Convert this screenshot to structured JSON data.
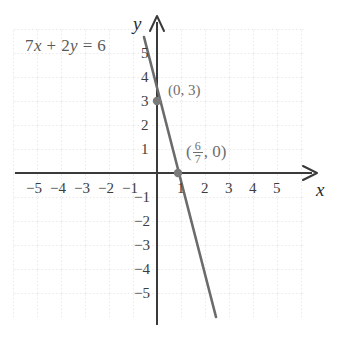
{
  "chart_data": {
    "type": "line",
    "title": "",
    "equation_label": "7x + 2y = 6",
    "equation_parts": {
      "coef_x": "7",
      "var_x": "x",
      "plus": "+",
      "coef_y": "2",
      "var_y": "y",
      "equals": "=",
      "constant": "6"
    },
    "xlabel": "x",
    "ylabel": "y",
    "xlim": [
      -6,
      6
    ],
    "ylim": [
      -6,
      6
    ],
    "grid": true,
    "grid_style": "dotted",
    "x_ticks": [
      -5,
      -4,
      -3,
      -2,
      -1,
      1,
      2,
      3,
      4,
      5
    ],
    "y_ticks": [
      5,
      4,
      3,
      2,
      1,
      -1,
      -2,
      -3,
      -4,
      -5
    ],
    "x_tick_labels": [
      "−5",
      "−4",
      "−3",
      "−2",
      "−1",
      "1",
      "2",
      "3",
      "4",
      "5"
    ],
    "y_tick_labels": [
      "5",
      "4",
      "3",
      "2",
      "1",
      "−1",
      "−2",
      "−3",
      "−4",
      "−5"
    ],
    "series": [
      {
        "name": "7x + 2y = 6",
        "slope": -3.5,
        "intercept": 3,
        "x_start": -0.55,
        "x_end": 2.45,
        "color": "#6b6b6b"
      }
    ],
    "points": [
      {
        "name": "y-intercept",
        "x": 0,
        "y": 3,
        "label": "(0, 3)"
      },
      {
        "name": "x-intercept",
        "x": 0.857,
        "y": 0,
        "label_prefix": "(",
        "label_num": "6",
        "label_den": "7",
        "label_suffix": ", 0)"
      }
    ],
    "colors": {
      "line": "#6b6b6b",
      "axis": "#3a3a3a",
      "grid": "#cfcfcf",
      "point": "#7a7a7a",
      "tick_text": "#3d3d3d",
      "equation_text": "#5a5a5a",
      "point_label_text": "#6e6e6e",
      "background": "#ffffff"
    }
  }
}
